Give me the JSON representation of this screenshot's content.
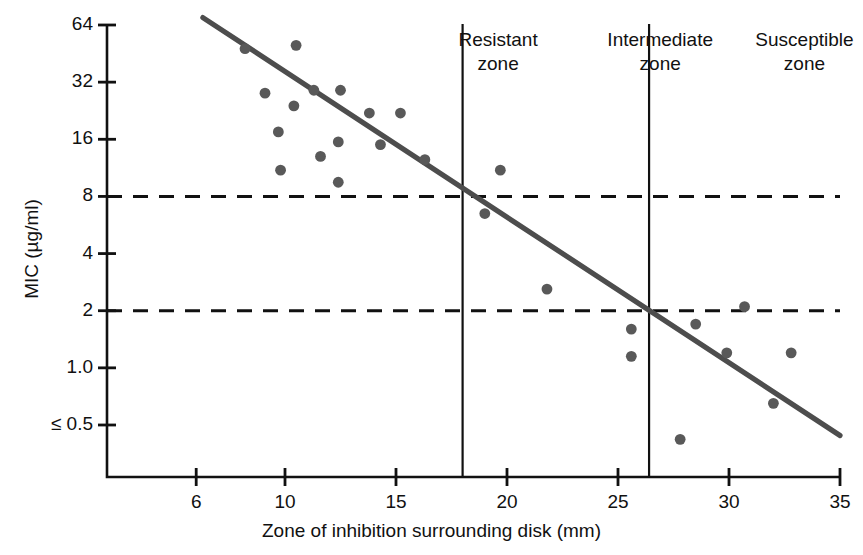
{
  "chart_data": {
    "type": "scatter",
    "title": "",
    "xlabel": "Zone of inhibition surrounding disk (mm)",
    "ylabel": "MIC (µg/ml)",
    "xlim": [
      4,
      35
    ],
    "ylim": [
      0.35,
      80
    ],
    "yscale": "log2",
    "grid": false,
    "legend": null,
    "xticks": [
      6,
      10,
      15,
      20,
      25,
      30,
      35
    ],
    "xtick_labels": [
      "6",
      "10",
      "15",
      "20",
      "25",
      "30",
      "35"
    ],
    "yticks": [
      64,
      32,
      16,
      8,
      4,
      2,
      1.0,
      0.5
    ],
    "ytick_labels": [
      "64",
      "32",
      "16",
      "8",
      "4",
      "2",
      "1.0",
      "≤ 0.5"
    ],
    "points": [
      {
        "x": 8.2,
        "y": 48
      },
      {
        "x": 9.1,
        "y": 28
      },
      {
        "x": 9.7,
        "y": 17.5
      },
      {
        "x": 9.8,
        "y": 11
      },
      {
        "x": 10.4,
        "y": 24
      },
      {
        "x": 10.5,
        "y": 50
      },
      {
        "x": 11.3,
        "y": 29
      },
      {
        "x": 11.6,
        "y": 13
      },
      {
        "x": 12.4,
        "y": 15.5
      },
      {
        "x": 12.5,
        "y": 29
      },
      {
        "x": 12.4,
        "y": 9.5
      },
      {
        "x": 13.8,
        "y": 22
      },
      {
        "x": 14.3,
        "y": 15
      },
      {
        "x": 15.2,
        "y": 22
      },
      {
        "x": 16.3,
        "y": 12.5
      },
      {
        "x": 19.0,
        "y": 6.5
      },
      {
        "x": 19.7,
        "y": 11
      },
      {
        "x": 21.8,
        "y": 2.6
      },
      {
        "x": 25.6,
        "y": 1.6
      },
      {
        "x": 25.6,
        "y": 1.15
      },
      {
        "x": 27.8,
        "y": 0.42
      },
      {
        "x": 28.5,
        "y": 1.7
      },
      {
        "x": 29.9,
        "y": 1.2
      },
      {
        "x": 30.7,
        "y": 2.1
      },
      {
        "x": 32.0,
        "y": 0.65
      },
      {
        "x": 32.8,
        "y": 1.2
      }
    ],
    "regression_line": {
      "x_start": 6.3,
      "y_start": 70,
      "x_end": 35.0,
      "y_end": 0.44
    },
    "breakpoint_lines": [
      {
        "orientation": "horizontal",
        "value": 8,
        "style": "dashed"
      },
      {
        "orientation": "horizontal",
        "value": 2,
        "style": "dashed"
      },
      {
        "orientation": "vertical",
        "value": 18,
        "style": "solid"
      },
      {
        "orientation": "vertical",
        "value": 26.4,
        "style": "solid"
      }
    ],
    "zones": [
      {
        "name": "resistant",
        "line1": "Resistant",
        "line2": "zone",
        "center_x": 19.6
      },
      {
        "name": "intermediate",
        "line1": "Intermediate",
        "line2": "zone",
        "center_x": 26.9
      },
      {
        "name": "susceptible",
        "line1": "Susceptible",
        "line2": "zone",
        "center_x": 33.4
      }
    ],
    "colors": {
      "point": "#595959",
      "regression": "#4d4d4d",
      "axis": "#111111",
      "dashed": "#111111",
      "background": "#ffffff"
    }
  }
}
